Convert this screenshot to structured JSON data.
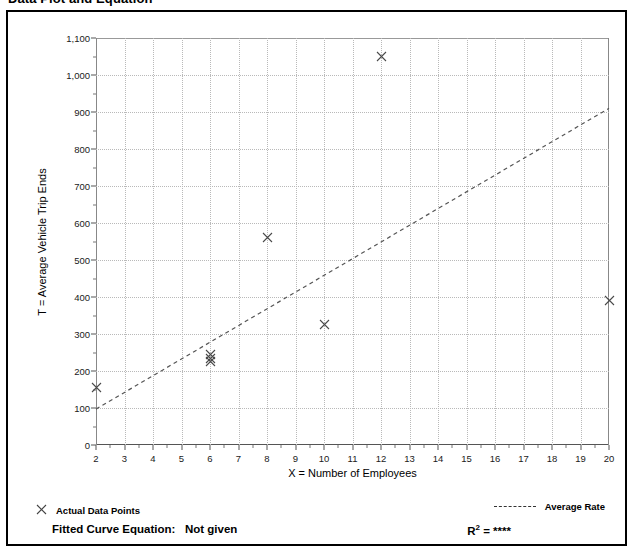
{
  "page": {
    "title": "Data Plot and Equation"
  },
  "chart_data": {
    "type": "scatter",
    "title": "Data Plot and Equation",
    "xlabel": "X = Number of Employees",
    "ylabel": "T = Average Vehicle Trip Ends",
    "xlim": [
      2,
      20
    ],
    "ylim": [
      0,
      1100
    ],
    "xticks": [
      2,
      3,
      4,
      5,
      6,
      7,
      8,
      9,
      10,
      11,
      12,
      13,
      14,
      15,
      16,
      17,
      18,
      19,
      20
    ],
    "xtick_labels": [
      "2",
      "3",
      "4",
      "5",
      "6",
      "7",
      "8",
      "9",
      "10",
      "11",
      "12",
      "13",
      "14",
      "15",
      "16",
      "17",
      "18",
      "19",
      "20"
    ],
    "yticks": [
      0,
      100,
      200,
      300,
      400,
      500,
      600,
      700,
      800,
      900,
      1000,
      1100
    ],
    "ytick_labels": [
      "0",
      "100",
      "200",
      "300",
      "400",
      "500",
      "600",
      "700",
      "800",
      "900",
      "1,000",
      "1,100"
    ],
    "y_minor_step": 50,
    "x_minor_step": 0.5,
    "grid": true,
    "legend_position": "below-plot",
    "series": [
      {
        "name": "Actual Data Points",
        "type": "scatter",
        "marker": "x",
        "points": [
          {
            "x": 2,
            "y": 155
          },
          {
            "x": 6,
            "y": 245
          },
          {
            "x": 6,
            "y": 235
          },
          {
            "x": 6,
            "y": 225
          },
          {
            "x": 8,
            "y": 560
          },
          {
            "x": 10,
            "y": 325
          },
          {
            "x": 12,
            "y": 1050
          },
          {
            "x": 20,
            "y": 390
          }
        ]
      },
      {
        "name": "Average Rate",
        "type": "line",
        "style": "dashed",
        "points": [
          {
            "x": 2,
            "y": 97
          },
          {
            "x": 20,
            "y": 910
          }
        ]
      }
    ]
  },
  "legend": {
    "data_points_label": "Actual Data Points",
    "data_points_marker": "x-marker-icon",
    "average_rate_label": "Average Rate",
    "average_rate_marker": "dashed-line-icon"
  },
  "footer": {
    "fitted_curve_label": "Fitted Curve Equation:",
    "fitted_curve_value": "Not given",
    "r2_label": "R",
    "r2_superscript": "2",
    "r2_equals": "=",
    "r2_value": "****"
  }
}
